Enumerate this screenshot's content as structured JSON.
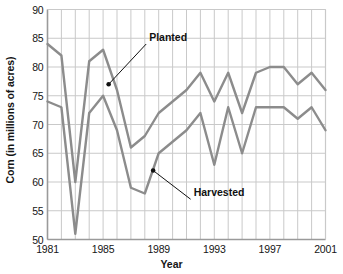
{
  "chart_data": {
    "type": "line",
    "title": "",
    "xlabel": "Year",
    "ylabel": "Corn (in millions of acres)",
    "x": [
      1981,
      1982,
      1983,
      1984,
      1985,
      1986,
      1987,
      1988,
      1989,
      1990,
      1991,
      1992,
      1993,
      1994,
      1995,
      1996,
      1997,
      1998,
      1999,
      2000,
      2001
    ],
    "xlim": [
      1981,
      2001
    ],
    "ylim": [
      50,
      90
    ],
    "xticks": [
      1981,
      1985,
      1989,
      1993,
      1997,
      2001
    ],
    "yticks": [
      50,
      55,
      60,
      65,
      70,
      75,
      80,
      85,
      90
    ],
    "grid": true,
    "legend_position": "inline-annotations",
    "series": [
      {
        "name": "Planted",
        "color": "#8c8c8c",
        "values": [
          84,
          82,
          60,
          81,
          83,
          76,
          66,
          68,
          72,
          74,
          76,
          79,
          74,
          79,
          72,
          79,
          80,
          80,
          77,
          79,
          76
        ]
      },
      {
        "name": "Harvested",
        "color": "#8c8c8c",
        "values": [
          74,
          73,
          51,
          72,
          75,
          69,
          59,
          58,
          65,
          67,
          69,
          72,
          63,
          73,
          65,
          73,
          73,
          73,
          71,
          73,
          69
        ]
      }
    ],
    "annotations": [
      {
        "label": "Planted",
        "point_year": 1985.4,
        "point_value": 77.0,
        "label_year": 1988.1,
        "label_value": 84.0
      },
      {
        "label": "Harvested",
        "point_year": 1988.6,
        "point_value": 62.0,
        "label_year": 1991.3,
        "label_value": 57.0
      }
    ]
  },
  "axis": {
    "ytick_labels": [
      "90",
      "85",
      "80",
      "75",
      "70",
      "65",
      "60",
      "55",
      "50"
    ],
    "xtick_labels": [
      "1981",
      "1985",
      "1989",
      "1993",
      "1997",
      "2001"
    ],
    "xlabel": "Year",
    "ylabel": "Corn (in millions of acres)"
  },
  "colors": {
    "line": "#8c8c8c",
    "grid": "#c9c9c9",
    "frame": "#9a9a9a",
    "text": "#151515",
    "annotation_leader": "#111111"
  }
}
